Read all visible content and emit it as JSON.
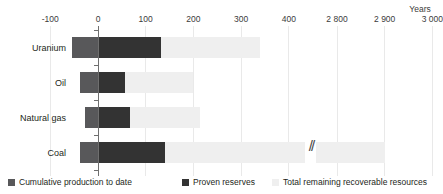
{
  "chart_data": {
    "type": "bar",
    "orientation": "horizontal",
    "title": "",
    "xlabel": "Years",
    "ylabel": "",
    "grid": true,
    "legend_position": "bottom",
    "axis_break": {
      "after": 400,
      "before": 2800,
      "symbol": "//"
    },
    "xticks": [
      {
        "label": "-100",
        "value": -100
      },
      {
        "label": "0",
        "value": 0
      },
      {
        "label": "100",
        "value": 100
      },
      {
        "label": "200",
        "value": 200
      },
      {
        "label": "300",
        "value": 300
      },
      {
        "label": "400",
        "value": 400
      },
      {
        "label": "2 800",
        "value": 2800
      },
      {
        "label": "2 900",
        "value": 2900
      },
      {
        "label": "3 000",
        "value": 3000
      }
    ],
    "xlim": [
      -100,
      3000
    ],
    "categories": [
      "Uranium",
      "Oil",
      "Natural gas",
      "Coal"
    ],
    "series": [
      {
        "name": "Cumulative production to date",
        "color": "#58585a",
        "values": [
          -55,
          -38,
          -27,
          -38
        ]
      },
      {
        "name": "Proven reserves",
        "color": "#333333",
        "values": [
          132,
          57,
          67,
          140
        ]
      },
      {
        "name": "Total remaining recoverable resources",
        "color": "#efefef",
        "values": [
          340,
          200,
          214,
          2900
        ]
      }
    ]
  },
  "axis": {
    "units_label": "Years"
  },
  "legend": {
    "items": [
      {
        "label": "Cumulative production to date",
        "color": "#58585a"
      },
      {
        "label": "Proven reserves",
        "color": "#333333"
      },
      {
        "label": "Total remaining recoverable resources",
        "color": "#efefef"
      }
    ]
  }
}
